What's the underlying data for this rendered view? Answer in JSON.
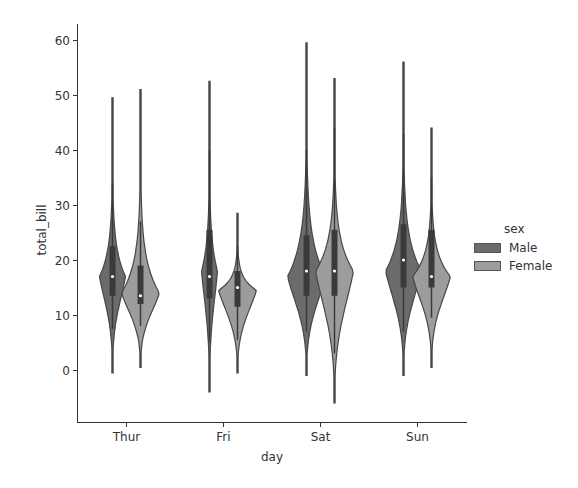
{
  "chart_data": {
    "type": "violin",
    "title": "",
    "xlabel": "day",
    "ylabel": "total_bill",
    "categories": [
      "Thur",
      "Fri",
      "Sat",
      "Sun"
    ],
    "yticks": [
      0,
      10,
      20,
      30,
      40,
      50,
      60
    ],
    "ylim": [
      -9.5,
      63
    ],
    "grid": false,
    "legend": {
      "title": "sex",
      "position": "right",
      "entries": [
        "Male",
        "Female"
      ]
    },
    "colors": {
      "Male": "#6b6b6b",
      "Female": "#9c9c9c",
      "outline": "#474747"
    },
    "series": [
      {
        "name": "Male",
        "violins": [
          {
            "category": "Thur",
            "min": -0.5,
            "max": 49.5,
            "median": 17,
            "q1": 13.5,
            "q3": 22.5,
            "whisker_low": 7.5,
            "whisker_high": 34,
            "mode": 17,
            "max_halfwidth": 13
          },
          {
            "category": "Fri",
            "min": -4,
            "max": 52.5,
            "median": 17,
            "q1": 13,
            "q3": 25.5,
            "whisker_low": 5,
            "whisker_high": 40,
            "mode": 18,
            "max_halfwidth": 8
          },
          {
            "category": "Sat",
            "min": -1,
            "max": 59.5,
            "median": 18,
            "q1": 13.5,
            "q3": 24.5,
            "whisker_low": 7,
            "whisker_high": 40,
            "mode": 17,
            "max_halfwidth": 19
          },
          {
            "category": "Sun",
            "min": -1,
            "max": 56,
            "median": 20,
            "q1": 15,
            "q3": 26.5,
            "whisker_low": 7,
            "whisker_high": 43,
            "mode": 18,
            "max_halfwidth": 18
          }
        ]
      },
      {
        "name": "Female",
        "violins": [
          {
            "category": "Thur",
            "min": 0.5,
            "max": 51,
            "median": 13.5,
            "q1": 12,
            "q3": 19,
            "whisker_low": 8,
            "whisker_high": 27,
            "mode": 14,
            "max_halfwidth": 19
          },
          {
            "category": "Fri",
            "min": -0.5,
            "max": 28.5,
            "median": 15,
            "q1": 11.5,
            "q3": 18,
            "whisker_low": 5.5,
            "whisker_high": 22.5,
            "mode": 14.5,
            "max_halfwidth": 19
          },
          {
            "category": "Sat",
            "min": -6,
            "max": 53,
            "median": 18,
            "q1": 13.5,
            "q3": 25.5,
            "whisker_low": 3,
            "whisker_high": 44,
            "mode": 18,
            "max_halfwidth": 19
          },
          {
            "category": "Sun",
            "min": 0.5,
            "max": 44,
            "median": 17,
            "q1": 15,
            "q3": 25.5,
            "whisker_low": 9.5,
            "whisker_high": 35,
            "mode": 17,
            "max_halfwidth": 19
          }
        ]
      }
    ]
  }
}
